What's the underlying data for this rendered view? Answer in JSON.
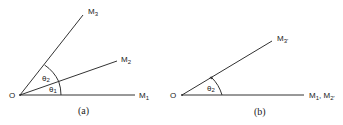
{
  "figure": {
    "panels": [
      {
        "id": "a",
        "caption": "(a)",
        "origin_label": "O",
        "rays": [
          {
            "label": "M",
            "sub": "1"
          },
          {
            "label": "M",
            "sub": "2"
          },
          {
            "label": "M",
            "sub": "3"
          }
        ],
        "angles": [
          {
            "label": "θ",
            "sub": "1"
          },
          {
            "label": "θ",
            "sub": "2"
          }
        ]
      },
      {
        "id": "b",
        "caption": "(b)",
        "origin_label": "O",
        "rays": [
          {
            "label": "M",
            "sub": "1",
            "suffix": ", M",
            "sub2": "2'"
          },
          {
            "label": "M",
            "sub": "3'"
          }
        ],
        "angles": [
          {
            "label": "θ",
            "sub": "2"
          }
        ]
      }
    ]
  }
}
